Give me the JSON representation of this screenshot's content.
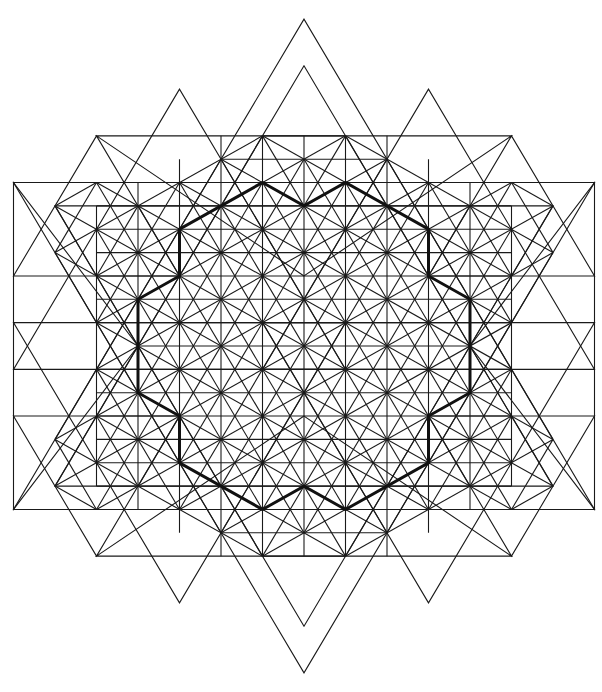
{
  "figure": {
    "title": "",
    "background": "#ffffff",
    "line_color": "#1a1a1a",
    "bold_color": "#111111",
    "center": [
      304,
      346
    ],
    "unit_x": 41.5,
    "unit_y": 23.35,
    "grid": {
      "x_range": [
        -4,
        4
      ],
      "y_range": [
        -7,
        7
      ],
      "vertical_lines_cols": [
        -4,
        -3,
        -2,
        -1,
        0,
        1,
        2,
        3,
        4
      ],
      "horizontal_lines_rows": [
        -7,
        -6,
        -5,
        -4,
        -3,
        -2,
        -1,
        0,
        1,
        2,
        3,
        4,
        5,
        6,
        7
      ]
    },
    "triangles": [
      {
        "name": "large-up-triangle",
        "points": [
          [
            0,
            -14
          ],
          [
            -7,
            7
          ],
          [
            7,
            7
          ]
        ]
      },
      {
        "name": "large-down-triangle",
        "points": [
          [
            0,
            14
          ],
          [
            -7,
            -7
          ],
          [
            7,
            -7
          ]
        ]
      },
      {
        "name": "mid-up-triangle",
        "points": [
          [
            0,
            -12
          ],
          [
            -6,
            6
          ],
          [
            6,
            6
          ]
        ]
      },
      {
        "name": "mid-down-triangle",
        "points": [
          [
            0,
            12
          ],
          [
            -6,
            -6
          ],
          [
            6,
            -6
          ]
        ]
      },
      {
        "name": "left-up-triangle",
        "points": [
          [
            -3,
            -11
          ],
          [
            -7,
            1
          ],
          [
            1,
            1
          ]
        ]
      },
      {
        "name": "right-up-triangle",
        "points": [
          [
            3,
            -11
          ],
          [
            -1,
            1
          ],
          [
            7,
            1
          ]
        ]
      },
      {
        "name": "left-down-triangle",
        "points": [
          [
            -3,
            11
          ],
          [
            -7,
            -1
          ],
          [
            1,
            -1
          ]
        ]
      },
      {
        "name": "right-down-triangle",
        "points": [
          [
            3,
            11
          ],
          [
            -1,
            -1
          ],
          [
            7,
            -1
          ]
        ]
      },
      {
        "name": "left-hex-up-triangle",
        "points": [
          [
            -5,
            -9
          ],
          [
            -7,
            -3
          ],
          [
            -3,
            -3
          ]
        ]
      },
      {
        "name": "right-hex-up-triangle",
        "points": [
          [
            5,
            -9
          ],
          [
            3,
            -3
          ],
          [
            7,
            -3
          ]
        ]
      },
      {
        "name": "top-center-down-triangle",
        "points": [
          [
            0,
            -3
          ],
          [
            -5,
            -9
          ],
          [
            5,
            -9
          ]
        ]
      },
      {
        "name": "left-hex-down-triangle",
        "points": [
          [
            -5,
            9
          ],
          [
            -7,
            3
          ],
          [
            -3,
            3
          ]
        ]
      },
      {
        "name": "right-hex-down-triangle",
        "points": [
          [
            5,
            9
          ],
          [
            3,
            3
          ],
          [
            7,
            3
          ]
        ]
      },
      {
        "name": "bottom-center-up-triangle",
        "points": [
          [
            0,
            3
          ],
          [
            -5,
            9
          ],
          [
            5,
            9
          ]
        ]
      },
      {
        "name": "far-left-up-triangle",
        "points": [
          [
            -7,
            -7
          ],
          [
            -7,
            7
          ],
          [
            -4,
            0
          ]
        ]
      },
      {
        "name": "far-right-triangle",
        "points": [
          [
            7,
            -7
          ],
          [
            7,
            7
          ],
          [
            4,
            0
          ]
        ]
      }
    ],
    "diagonal_families": {
      "slopes": [
        "+1",
        "-1"
      ],
      "note": "diagonals through lattice points at ±30° and ±60° filling the central region"
    },
    "bold_polygon": {
      "name": "eighteen-gon-outline",
      "points": [
        [
          -1,
          -7
        ],
        [
          0,
          -6
        ],
        [
          1,
          -7
        ],
        [
          3,
          -5
        ],
        [
          3,
          -3
        ],
        [
          4,
          -2
        ],
        [
          4,
          2
        ],
        [
          3,
          3
        ],
        [
          3,
          5
        ],
        [
          1,
          7
        ],
        [
          0,
          6
        ],
        [
          -1,
          7
        ],
        [
          -3,
          5
        ],
        [
          -3,
          3
        ],
        [
          -4,
          2
        ],
        [
          -4,
          -2
        ],
        [
          -3,
          -3
        ],
        [
          -3,
          -5
        ]
      ]
    }
  }
}
